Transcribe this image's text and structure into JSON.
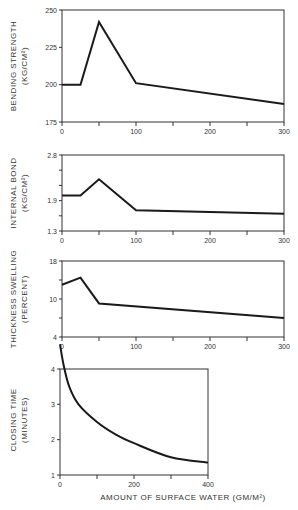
{
  "chart_data": [
    {
      "type": "line",
      "title": "",
      "ylabel": "BENDING STRENGTH (KG/CM²)",
      "ylabel_line1": "BENDING STRENGTH",
      "ylabel_line2": "(KG/CM²)",
      "xlabel": "",
      "x": [
        0,
        25,
        50,
        100,
        300
      ],
      "values": [
        200,
        200,
        242,
        201,
        187
      ],
      "ylim": [
        175,
        250
      ],
      "xlim": [
        0,
        300
      ],
      "yticks": [
        175,
        200,
        225,
        250
      ],
      "ytick_labels": [
        "175",
        "200",
        "225",
        "250"
      ],
      "xticks": [
        0,
        50,
        100,
        150,
        200,
        250,
        300
      ],
      "xtick_labels": [
        "0",
        "100",
        "200",
        "300"
      ],
      "grid": false
    },
    {
      "type": "line",
      "title": "",
      "ylabel": "INTERNAL BOND (KG/CM²)",
      "ylabel_line1": "INTERNAL BOND",
      "ylabel_line2": "(KG/CM²)",
      "xlabel": "",
      "x": [
        0,
        25,
        50,
        100,
        300
      ],
      "values": [
        2.0,
        2.0,
        2.32,
        1.71,
        1.64
      ],
      "ylim": [
        1.3,
        2.8
      ],
      "xlim": [
        0,
        300
      ],
      "yticks": [
        1.3,
        1.6,
        1.9,
        2.2,
        2.5,
        2.8
      ],
      "ytick_labels": [
        "1.3",
        "1.9",
        "2.8"
      ],
      "xticks": [
        0,
        50,
        100,
        150,
        200,
        250,
        300
      ],
      "xtick_labels": [
        "0",
        "100",
        "200",
        "300"
      ],
      "grid": false
    },
    {
      "type": "line",
      "title": "",
      "ylabel": "THICKNESS SWELLING (PERCENT)",
      "ylabel_line1": "THICKNESS SWELLING",
      "ylabel_line2": "(PERCENT)",
      "xlabel": "",
      "x": [
        0,
        25,
        50,
        300
      ],
      "values": [
        13,
        14.5,
        9.3,
        7
      ],
      "ylim": [
        4,
        18
      ],
      "xlim": [
        0,
        300
      ],
      "yticks": [
        4,
        7,
        10,
        14,
        18
      ],
      "ytick_labels": [
        "4",
        "10",
        "18"
      ],
      "xticks": [
        0,
        50,
        100,
        150,
        200,
        250,
        300
      ],
      "xtick_labels": [
        "0",
        "100",
        "200",
        "300"
      ],
      "grid": false
    },
    {
      "type": "line",
      "title": "",
      "ylabel": "CLOSING TIME (MINUTES)",
      "ylabel_line1": "CLOSING TIME",
      "ylabel_line2": "(MINUTES)",
      "xlabel": "AMOUNT OF SURFACE WATER (GM/M²)",
      "x": [
        0,
        10,
        25,
        50,
        100,
        150,
        200,
        300,
        400
      ],
      "values": [
        4.7,
        4.1,
        3.5,
        3.0,
        2.5,
        2.15,
        1.9,
        1.5,
        1.35
      ],
      "ylim": [
        1,
        4.75
      ],
      "xlim": [
        0,
        400
      ],
      "yticks": [
        1,
        2,
        3,
        4
      ],
      "ytick_labels": [
        "1",
        "2",
        "3",
        "4"
      ],
      "xticks": [
        0,
        100,
        200,
        300,
        400
      ],
      "xtick_labels": [
        "0",
        "200",
        "400"
      ],
      "grid": false
    }
  ]
}
